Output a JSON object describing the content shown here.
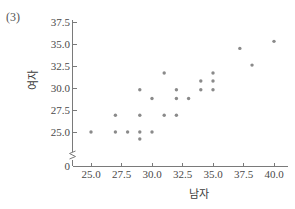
{
  "figure": {
    "number_label": "(3)"
  },
  "chart_data": {
    "type": "scatter",
    "title": "",
    "xlabel": "남자",
    "ylabel": "여자",
    "xlim": [
      23.6,
      41.2
    ],
    "ylim": [
      23.3,
      37.5
    ],
    "xticks": [
      "25.0",
      "27.5",
      "30.0",
      "32.5",
      "35.0",
      "37.5",
      "40.0"
    ],
    "xtick_values": [
      25.0,
      27.5,
      30.0,
      32.5,
      35.0,
      37.5,
      40.0
    ],
    "yticks": [
      "0",
      "25.0",
      "27.5",
      "30.0",
      "32.5",
      "35.0",
      "37.5"
    ],
    "ytick_values": [
      23.35,
      25.0,
      27.5,
      30.0,
      32.5,
      35.0,
      37.5
    ],
    "y_axis_break": true,
    "grid": false,
    "legend": false,
    "marker_color": "#8a8a8a",
    "points": [
      [
        25.0,
        25.0
      ],
      [
        27.0,
        26.9
      ],
      [
        27.0,
        25.0
      ],
      [
        28.0,
        25.0
      ],
      [
        29.0,
        29.8
      ],
      [
        29.0,
        26.9
      ],
      [
        29.0,
        25.0
      ],
      [
        29.0,
        24.2
      ],
      [
        30.0,
        28.8
      ],
      [
        30.0,
        25.0
      ],
      [
        31.0,
        31.7
      ],
      [
        31.0,
        26.9
      ],
      [
        32.0,
        29.8
      ],
      [
        32.0,
        28.8
      ],
      [
        32.0,
        26.9
      ],
      [
        33.0,
        28.8
      ],
      [
        34.0,
        30.8
      ],
      [
        34.0,
        29.8
      ],
      [
        35.0,
        31.7
      ],
      [
        35.0,
        30.8
      ],
      [
        35.0,
        29.8
      ],
      [
        37.2,
        34.5
      ],
      [
        38.2,
        32.6
      ],
      [
        40.0,
        35.3
      ]
    ]
  }
}
